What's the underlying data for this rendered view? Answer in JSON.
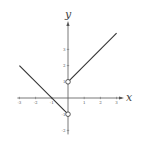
{
  "chart_data": {
    "type": "line",
    "title": "",
    "xlabel": "x",
    "ylabel": "y",
    "xlim": [
      -3,
      3
    ],
    "ylim": [
      -2,
      3
    ],
    "x_ticks": [
      -3,
      -2,
      -1,
      1,
      2,
      3
    ],
    "x_tick_labels": [
      "-3",
      "-2",
      "-1",
      "1",
      "2",
      "3"
    ],
    "y_ticks": [
      -2,
      -1,
      1,
      2,
      3
    ],
    "y_tick_labels": [
      "-2",
      "-1",
      "1",
      "2",
      "3"
    ],
    "grid": false,
    "series": [
      {
        "name": "left-branch",
        "x": [
          -3,
          0
        ],
        "y": [
          2,
          -1
        ],
        "open_endpoint": [
          0,
          -1
        ]
      },
      {
        "name": "right-branch",
        "x": [
          0,
          3
        ],
        "y": [
          1,
          4
        ],
        "open_endpoint": [
          0,
          1
        ]
      }
    ],
    "colors": {
      "line": "#333333",
      "axis": "#555555"
    }
  }
}
